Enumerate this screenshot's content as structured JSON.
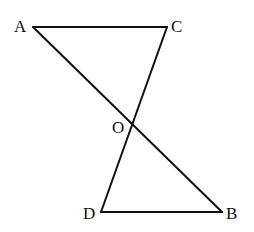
{
  "diagram": {
    "type": "geometry",
    "points": {
      "A": {
        "label": "A",
        "x": 33,
        "y": 27
      },
      "C": {
        "label": "C",
        "x": 167,
        "y": 27
      },
      "O": {
        "label": "O",
        "x": 133,
        "y": 124
      },
      "D": {
        "label": "D",
        "x": 101,
        "y": 212
      },
      "B": {
        "label": "B",
        "x": 222,
        "y": 212
      }
    },
    "segments": [
      "AC",
      "AB",
      "CD",
      "DB"
    ],
    "line_color": "#111111"
  }
}
